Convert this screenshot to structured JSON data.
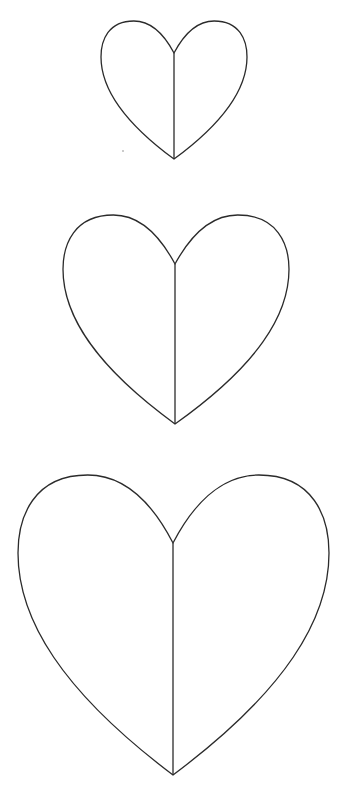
{
  "page": {
    "background": "#ffffff",
    "stroke_color": "#2b2b2b"
  },
  "hearts": [
    {
      "size": "small",
      "left": 101,
      "right": 247,
      "top": 21,
      "cleft_y": 53,
      "tip_y": 159,
      "center_x": 174
    },
    {
      "size": "medium",
      "left": 63,
      "right": 289,
      "top": 215,
      "cleft_y": 264,
      "tip_y": 424,
      "center_x": 175
    },
    {
      "size": "large",
      "left": 18,
      "right": 329,
      "top": 475,
      "cleft_y": 543,
      "tip_y": 775,
      "center_x": 173
    }
  ]
}
